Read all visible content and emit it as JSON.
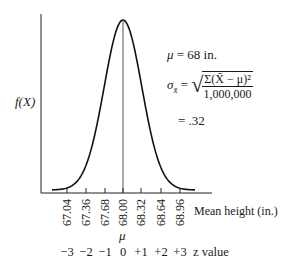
{
  "chart_data": {
    "type": "line",
    "title": "",
    "subtitle": "Sampling distribution of the mean (normal curve)",
    "xlabel": "Mean height (in.)",
    "ylabel": "f(X)",
    "x_ticks": [
      "67.04",
      "67.36",
      "67.68",
      "68.00",
      "68.32",
      "68.64",
      "68.96"
    ],
    "x_tick_values": [
      67.04,
      67.36,
      67.68,
      68.0,
      68.32,
      68.64,
      68.96
    ],
    "z_ticks": [
      "−3",
      "−2",
      "−1",
      "0",
      "+1",
      "+2",
      "+3"
    ],
    "z_label": "z value",
    "mean_marker_label": "μ",
    "series": [
      {
        "name": "Normal density",
        "mean": 68.0,
        "sd": 0.32,
        "shape": "bell curve, symmetric about 68.00"
      }
    ],
    "vertical_line_at": 68.0,
    "grid": false,
    "legend": "none",
    "annotations": [
      "μ = 68 in.",
      "σ_x̄ = √(Σ(X̄ − μ)² / 1,000,000)",
      "= .32"
    ]
  },
  "labels": {
    "y_axis": "f(X)",
    "x_axis": "Mean height (in.)",
    "mu_symbol": "μ",
    "z_axis": "z value",
    "ticks": [
      "67.04",
      "67.36",
      "67.68",
      "68.00",
      "68.32",
      "68.64",
      "68.96"
    ],
    "z_values": [
      "−3",
      "−2",
      "−1",
      "0",
      "+1",
      "+2",
      "+3"
    ]
  },
  "formula": {
    "mu_line_symbol": "μ",
    "mu_line_rest": " = 68 in.",
    "sigma_symbol": "σ",
    "sigma_sub": "x̄",
    "equals": " =",
    "numerator": "Σ(X̄ − μ)²",
    "denominator": "1,000,000",
    "result": "= .32"
  }
}
